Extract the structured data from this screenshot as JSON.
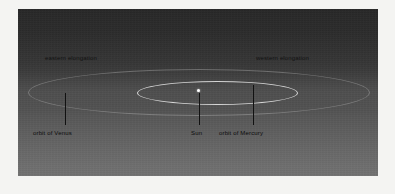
{
  "figure": {
    "kind": "astronomy-diagram",
    "background": {
      "top_color": "#272727",
      "bottom_color": "#717171",
      "mat_color": "#f4f4f2"
    }
  },
  "labels": {
    "eastern_elongation": "eastern elongation",
    "western_elongation": "western elongation",
    "orbit_of_venus": "orbit of Venus",
    "sun": "Sun",
    "orbit_of_mercury": "orbit of Mercury"
  },
  "objects": {
    "sun": {
      "name": "Sun",
      "color": "#ffffff",
      "center_x": 199,
      "center_y": 92
    },
    "mercury_orbit": {
      "name": "orbit of Mercury",
      "color": "#ebebeb",
      "width": 161,
      "height": 24
    },
    "venus_orbit": {
      "name": "orbit of Venus",
      "color": "#cdcdcd",
      "width": 342,
      "height": 47
    }
  },
  "leader_lines": {
    "color": "#111111",
    "targets": [
      "orbit of Venus",
      "Sun",
      "orbit of Mercury"
    ]
  }
}
